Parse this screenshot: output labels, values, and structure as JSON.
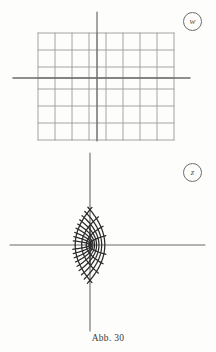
{
  "figure": {
    "caption": "Abb. 30",
    "background_color": "#fdfdfc",
    "ink_color": "#3a3a3a"
  },
  "panels": [
    {
      "id": "w-plane",
      "label": "w",
      "label_shape": "circled",
      "description": "Cartesian rectangular grid in the w-plane",
      "grid_color": "#9a9a9a",
      "axis_color": "#6b6b6b",
      "axes": {
        "origin": [
          97,
          78
        ],
        "x_axis": {
          "x_start": 13,
          "x_end": 190,
          "y": 78
        },
        "y_axis": {
          "y_start": 12,
          "y_end": 141,
          "x": 97
        }
      },
      "grid": {
        "spacing": 17,
        "vertical_lines_x": [
          38,
          55,
          72,
          89,
          97,
          106,
          123,
          140,
          157,
          174
        ],
        "horizontal_lines_y": [
          33,
          50,
          67,
          78,
          89,
          106,
          123,
          140
        ],
        "extent": {
          "left": 38,
          "right": 174,
          "top": 33,
          "bottom": 140
        }
      }
    },
    {
      "id": "z-plane",
      "label": "z",
      "label_shape": "circled",
      "description": "Image of the rectangular grid under the conformal map; curvilinear net of confocal parabola-like curves with a cusp at the branch point",
      "curve_color": "#2b2b2b",
      "axis_color": "#6b6b6b",
      "axes": {
        "origin": [
          90,
          245
        ],
        "branch_point": [
          90,
          245
        ],
        "x_axis": {
          "x_start": 10,
          "x_end": 205,
          "y": 245
        },
        "y_axis": {
          "y_start": 153,
          "y_end": 331,
          "x": 90
        }
      },
      "net": {
        "family_a_count": 9,
        "family_b_count": 8,
        "symmetry": "mirror about horizontal axis",
        "opening_direction": "right"
      }
    }
  ],
  "chart_data": {
    "type": "line",
    "title": "Abb. 30",
    "xlabel": "",
    "ylabel": "",
    "series": [
      {
        "name": "w-plane vertical grid lines",
        "values": [
          -3,
          -2,
          -1,
          0,
          1,
          2,
          3,
          4,
          5
        ]
      },
      {
        "name": "w-plane horizontal grid lines",
        "values": [
          -3,
          -2,
          -1,
          0,
          1,
          2,
          3
        ]
      },
      {
        "name": "z-plane image curves (family u = const)",
        "values": [
          1,
          2,
          3,
          4,
          5,
          6,
          7,
          8,
          9
        ]
      },
      {
        "name": "z-plane image curves (family v = const)",
        "values": [
          -4,
          -3,
          -2,
          -1,
          1,
          2,
          3,
          4
        ]
      }
    ],
    "grid": true,
    "legend": "none"
  }
}
